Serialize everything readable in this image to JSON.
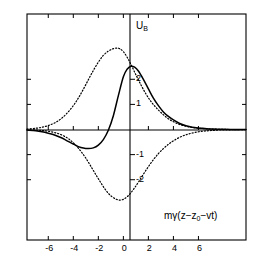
{
  "chart_data": {
    "type": "line",
    "title": "",
    "xlabel": "mγ(z−z₀−vt)",
    "ylabel": "U_B",
    "ylabel_base": "U",
    "ylabel_sub": "B",
    "xlim": [
      -7.7,
      9.8
    ],
    "ylim": [
      -4.4,
      4.6
    ],
    "xticks": [
      -6,
      -4,
      -2,
      0,
      2,
      4,
      6
    ],
    "xtick_labels": [
      "-6",
      "-4",
      "-2",
      "0",
      "2",
      "4",
      "6"
    ],
    "yticks": [
      2,
      1,
      -1,
      -2
    ],
    "ytick_labels": [
      "2",
      "1",
      "-1",
      "-2"
    ],
    "grid": false,
    "legend": "none",
    "frame": true,
    "axis_lines": [
      "x=0",
      "y=0"
    ],
    "series": [
      {
        "name": "solid-curve",
        "style": "solid",
        "color": "#000000",
        "x": [
          -7.7,
          -7.0,
          -6.5,
          -6.0,
          -5.5,
          -5.0,
          -4.5,
          -4.0,
          -3.6,
          -3.2,
          -2.8,
          -2.4,
          -2.0,
          -1.6,
          -1.2,
          -0.8,
          -0.4,
          0.0,
          0.3,
          0.6,
          0.9,
          1.2,
          1.6,
          2.0,
          2.4,
          2.8,
          3.2,
          3.6,
          4.0,
          4.5,
          5.0,
          5.5,
          6.0,
          6.5,
          7.0,
          7.7,
          8.6,
          9.8
        ],
        "y": [
          -0.02,
          -0.05,
          -0.09,
          -0.15,
          -0.22,
          -0.32,
          -0.45,
          -0.58,
          -0.68,
          -0.74,
          -0.76,
          -0.73,
          -0.62,
          -0.4,
          -0.03,
          0.55,
          1.35,
          2.1,
          2.4,
          2.52,
          2.48,
          2.33,
          2.0,
          1.62,
          1.25,
          0.95,
          0.7,
          0.52,
          0.38,
          0.24,
          0.15,
          0.09,
          0.06,
          0.04,
          0.02,
          0.01,
          0.0,
          0.0
        ]
      },
      {
        "name": "dotted-upper-curve",
        "style": "dotted",
        "color": "#000000",
        "x": [
          -7.7,
          -7.0,
          -6.5,
          -6.0,
          -5.5,
          -5.0,
          -4.5,
          -4.0,
          -3.6,
          -3.2,
          -2.8,
          -2.4,
          -2.0,
          -1.6,
          -1.2,
          -0.8,
          -0.5,
          -0.3,
          0.0,
          0.3,
          0.6,
          1.0,
          1.4,
          1.8,
          2.2,
          2.6,
          3.0,
          3.5,
          4.0,
          4.5,
          5.0,
          5.5,
          6.0,
          6.5,
          7.0,
          7.7,
          8.6,
          9.8
        ],
        "y": [
          0.02,
          0.05,
          0.09,
          0.16,
          0.26,
          0.42,
          0.65,
          0.95,
          1.25,
          1.6,
          1.98,
          2.35,
          2.68,
          2.95,
          3.12,
          3.22,
          3.24,
          3.22,
          3.1,
          2.88,
          2.6,
          2.18,
          1.78,
          1.42,
          1.12,
          0.88,
          0.68,
          0.46,
          0.31,
          0.2,
          0.13,
          0.08,
          0.05,
          0.03,
          0.02,
          0.01,
          0.0,
          0.0
        ]
      },
      {
        "name": "dotted-lower-curve",
        "style": "dotted",
        "color": "#000000",
        "x": [
          -7.7,
          -7.0,
          -6.5,
          -6.0,
          -5.5,
          -5.0,
          -4.5,
          -4.2,
          -3.9,
          -3.6,
          -3.3,
          -3.0,
          -2.7,
          -2.4,
          -2.1,
          -1.8,
          -1.5,
          -1.2,
          -0.9,
          -0.6,
          -0.3,
          0.0,
          0.3,
          0.6,
          0.9,
          1.2,
          1.6,
          2.0,
          2.4,
          2.8,
          3.2,
          3.6,
          4.0,
          4.5,
          5.0,
          5.5,
          6.0,
          6.5,
          7.0,
          7.7,
          8.6,
          9.8
        ],
        "y": [
          -0.01,
          -0.02,
          -0.04,
          -0.07,
          -0.12,
          -0.2,
          -0.33,
          -0.44,
          -0.58,
          -0.74,
          -0.93,
          -1.14,
          -1.38,
          -1.63,
          -1.88,
          -2.12,
          -2.35,
          -2.54,
          -2.68,
          -2.77,
          -2.81,
          -2.78,
          -2.68,
          -2.52,
          -2.32,
          -2.1,
          -1.78,
          -1.48,
          -1.2,
          -0.96,
          -0.76,
          -0.59,
          -0.45,
          -0.31,
          -0.21,
          -0.14,
          -0.09,
          -0.06,
          -0.04,
          -0.02,
          -0.01,
          0.0
        ]
      }
    ]
  },
  "ticks": {
    "x": [
      {
        "label": "-6",
        "value": -6
      },
      {
        "label": "-4",
        "value": -4
      },
      {
        "label": "-2",
        "value": -2
      },
      {
        "label": "0",
        "value": 0
      },
      {
        "label": "2",
        "value": 2
      },
      {
        "label": "4",
        "value": 4
      },
      {
        "label": "6",
        "value": 6
      }
    ],
    "y": [
      {
        "label": "2",
        "value": 2
      },
      {
        "label": "1",
        "value": 1
      },
      {
        "label": "-1",
        "value": -1
      },
      {
        "label": "-2",
        "value": -2
      }
    ]
  },
  "labels": {
    "y_axis_main": "U",
    "y_axis_sub": "B",
    "x_axis_full": "mγ(z−z₀−vt)",
    "x_axis_prefix": "mγ(z−z",
    "x_axis_sub": "0",
    "x_axis_suffix": "−vt)"
  },
  "colors": {
    "line": "#000000",
    "frame": "#000000",
    "background": "#ffffff"
  }
}
